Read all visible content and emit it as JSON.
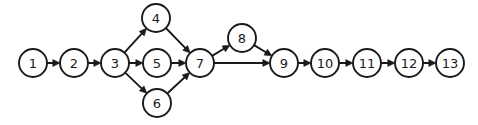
{
  "diagram": {
    "type": "directed-graph",
    "title": "",
    "background_color": "#ffffff",
    "node_color": "#ffffff",
    "stroke_color": "#1a1a1a",
    "node_radius": 14,
    "canvas": {
      "width": 478,
      "height": 125
    },
    "nodes": [
      {
        "id": "1",
        "label": "1",
        "x": 33,
        "y": 63
      },
      {
        "id": "2",
        "label": "2",
        "x": 74,
        "y": 63
      },
      {
        "id": "3",
        "label": "3",
        "x": 115,
        "y": 63
      },
      {
        "id": "4",
        "label": "4",
        "x": 156,
        "y": 18
      },
      {
        "id": "5",
        "label": "5",
        "x": 157,
        "y": 63
      },
      {
        "id": "6",
        "label": "6",
        "x": 157,
        "y": 103
      },
      {
        "id": "7",
        "label": "7",
        "x": 200,
        "y": 63
      },
      {
        "id": "8",
        "label": "8",
        "x": 242,
        "y": 38
      },
      {
        "id": "9",
        "label": "9",
        "x": 284,
        "y": 63
      },
      {
        "id": "10",
        "label": "10",
        "x": 325,
        "y": 63
      },
      {
        "id": "11",
        "label": "11",
        "x": 367,
        "y": 63
      },
      {
        "id": "12",
        "label": "12",
        "x": 409,
        "y": 63
      },
      {
        "id": "13",
        "label": "13",
        "x": 450,
        "y": 63
      }
    ],
    "edges": [
      {
        "from": "1",
        "to": "2",
        "directed": true
      },
      {
        "from": "2",
        "to": "3",
        "directed": true
      },
      {
        "from": "3",
        "to": "4",
        "directed": true
      },
      {
        "from": "3",
        "to": "5",
        "directed": true
      },
      {
        "from": "3",
        "to": "6",
        "directed": true
      },
      {
        "from": "4",
        "to": "7",
        "directed": true
      },
      {
        "from": "5",
        "to": "7",
        "directed": true
      },
      {
        "from": "6",
        "to": "7",
        "directed": true
      },
      {
        "from": "7",
        "to": "8",
        "directed": true
      },
      {
        "from": "7",
        "to": "9",
        "directed": true
      },
      {
        "from": "8",
        "to": "9",
        "directed": true
      },
      {
        "from": "9",
        "to": "10",
        "directed": true
      },
      {
        "from": "10",
        "to": "11",
        "directed": true
      },
      {
        "from": "11",
        "to": "12",
        "directed": true
      },
      {
        "from": "12",
        "to": "13",
        "directed": true
      }
    ]
  }
}
